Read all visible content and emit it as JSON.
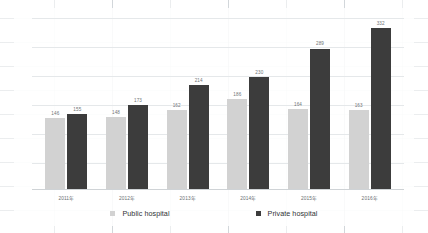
{
  "chart_data": {
    "type": "bar",
    "title": "",
    "subtitle": "",
    "xlabel": "",
    "ylabel": "",
    "grid": true,
    "legend_position": "bottom",
    "ylim": [
      0,
      360
    ],
    "categories": [
      "2011年",
      "2012年",
      "2013年",
      "2014年",
      "2015年",
      "2016年"
    ],
    "series": [
      {
        "name": "Public hospital",
        "color": "#d2d2d2",
        "values": [
          146,
          148,
          162,
          186,
          164,
          163
        ]
      },
      {
        "name": "Private hospital",
        "color": "#3c3c3c",
        "values": [
          155,
          173,
          214,
          230,
          289,
          332
        ]
      }
    ],
    "data_labels": [
      [
        "146",
        "155"
      ],
      [
        "148",
        "173"
      ],
      [
        "162",
        "214"
      ],
      [
        "186",
        "230"
      ],
      [
        "164",
        "289"
      ],
      [
        "163",
        "332"
      ]
    ]
  },
  "legend": {
    "items": [
      {
        "label": "Public hospital",
        "swatch": "public-series-swatch"
      },
      {
        "label": "Private hospital",
        "swatch": "private-series-swatch"
      }
    ]
  }
}
